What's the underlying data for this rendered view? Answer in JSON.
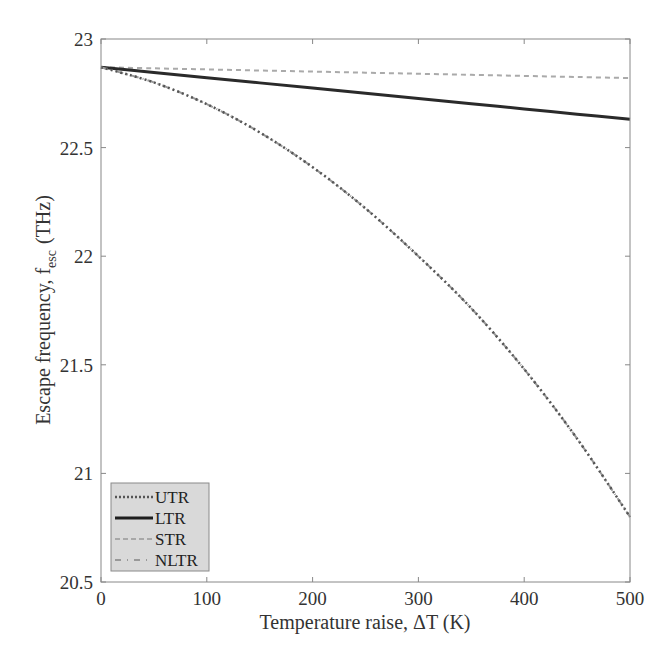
{
  "chart_data": {
    "type": "line",
    "title": "",
    "xlabel": "Temperature raise, ΔT (K)",
    "ylabel_main": "Escape frequency, f",
    "ylabel_sub": "esc",
    "ylabel_unit": "(THz)",
    "ylabel": "Escape frequency, f_esc (THz)",
    "xlim": [
      0,
      500
    ],
    "ylim": [
      20.5,
      23
    ],
    "xticks": [
      0,
      100,
      200,
      300,
      400,
      500
    ],
    "yticks": [
      20.5,
      21,
      21.5,
      22,
      22.5,
      23
    ],
    "xtick_labels": [
      "0",
      "100",
      "200",
      "300",
      "400",
      "500"
    ],
    "ytick_labels": [
      "20.5",
      "21",
      "21.5",
      "22",
      "22.5",
      "23"
    ],
    "grid": false,
    "legend_position": "lower left",
    "x": [
      0,
      50,
      100,
      150,
      200,
      250,
      300,
      350,
      400,
      450,
      500
    ],
    "series": [
      {
        "name": "UTR",
        "style": "dotted",
        "color": "#555555",
        "values": [
          22.87,
          22.8,
          22.7,
          22.57,
          22.41,
          22.22,
          22.0,
          21.76,
          21.48,
          21.16,
          20.8
        ]
      },
      {
        "name": "LTR",
        "style": "solid",
        "color": "#2a2a2a",
        "values": [
          22.87,
          22.846,
          22.822,
          22.798,
          22.774,
          22.75,
          22.726,
          22.702,
          22.678,
          22.654,
          22.63
        ]
      },
      {
        "name": "STR",
        "style": "dashed",
        "color": "#aaaaaa",
        "values": [
          22.87,
          22.865,
          22.86,
          22.855,
          22.85,
          22.845,
          22.84,
          22.835,
          22.83,
          22.825,
          22.82
        ]
      },
      {
        "name": "NLTR",
        "style": "dashdot",
        "color": "#999999",
        "values": [
          22.87,
          22.8,
          22.7,
          22.57,
          22.41,
          22.22,
          22.0,
          21.76,
          21.48,
          21.16,
          20.8
        ]
      }
    ]
  },
  "legend": {
    "items": [
      {
        "label": "UTR"
      },
      {
        "label": "LTR"
      },
      {
        "label": "STR"
      },
      {
        "label": "NLTR"
      }
    ]
  }
}
